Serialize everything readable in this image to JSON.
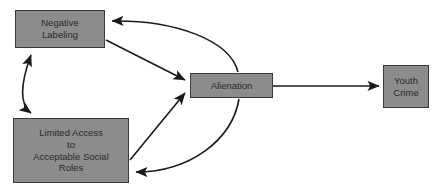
{
  "diagram": {
    "background_color": "#ffffff",
    "node_fill_color": "#8c8c8c",
    "node_border_color": "#3a3a3a",
    "arrow_color": "#1a1a1a",
    "text_color": "#2b2b2b",
    "nodes": [
      {
        "id": "negative-labeling",
        "label": "Negative\nLabeling",
        "x": 15,
        "y": 10,
        "width": 90,
        "height": 38
      },
      {
        "id": "limited-access",
        "label": "Limited Access\nto\nAcceptable Social\nRoles",
        "x": 13,
        "y": 118,
        "width": 116,
        "height": 65
      },
      {
        "id": "alienation",
        "label": "Alienation",
        "x": 190,
        "y": 73,
        "width": 83,
        "height": 25
      },
      {
        "id": "youth-crime",
        "label": "Youth\nCrime",
        "x": 383,
        "y": 65,
        "width": 46,
        "height": 43
      }
    ],
    "edges": [
      {
        "id": "negative-labeling-to-limited-access",
        "from": "negative-labeling",
        "to": "limited-access",
        "style": "curved",
        "arrowheads": "both",
        "description": "double-headed curved arrow linking Negative Labeling and Limited Access to Acceptable Social Roles"
      },
      {
        "id": "negative-labeling-to-alienation",
        "from": "negative-labeling",
        "to": "alienation",
        "style": "straight",
        "arrowheads": "end",
        "description": "straight arrow from Negative Labeling to Alienation"
      },
      {
        "id": "alienation-to-negative-labeling",
        "from": "alienation",
        "to": "negative-labeling",
        "style": "curved",
        "arrowheads": "end",
        "description": "curved feedback arrow from Alienation back to Negative Labeling"
      },
      {
        "id": "limited-access-to-alienation",
        "from": "limited-access",
        "to": "alienation",
        "style": "straight",
        "arrowheads": "end",
        "description": "straight arrow from Limited Access to Acceptable Social Roles to Alienation"
      },
      {
        "id": "alienation-to-limited-access",
        "from": "alienation",
        "to": "limited-access",
        "style": "curved",
        "arrowheads": "end",
        "description": "curved feedback arrow from Alienation back to Limited Access to Acceptable Social Roles"
      },
      {
        "id": "alienation-to-youth-crime",
        "from": "alienation",
        "to": "youth-crime",
        "style": "straight",
        "arrowheads": "end",
        "description": "straight horizontal arrow from Alienation to Youth Crime"
      }
    ]
  }
}
